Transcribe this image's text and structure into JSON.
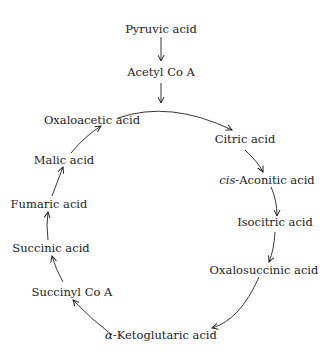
{
  "diagram": {
    "entry": [
      {
        "label": "Pyruvic acid"
      },
      {
        "label": "Acetyl Co A"
      }
    ],
    "cycle": [
      {
        "label": "Oxaloacetic acid"
      },
      {
        "label": "Citric acid"
      },
      {
        "prefix": "cis",
        "label": "-Aconitic acid"
      },
      {
        "label": "Isocitric acid"
      },
      {
        "label": "Oxalosuccinic acid"
      },
      {
        "prefix": "α",
        "label": "-Ketoglutaric acid"
      },
      {
        "label": "Succinyl Co A"
      },
      {
        "label": "Succinic acid"
      },
      {
        "label": "Fumaric acid"
      },
      {
        "label": "Malic acid"
      }
    ],
    "edges": [
      [
        "Pyruvic acid",
        "Acetyl Co A"
      ],
      [
        "Acetyl Co A",
        "Citric acid"
      ],
      [
        "Oxaloacetic acid",
        "Citric acid"
      ],
      [
        "Citric acid",
        "cis-Aconitic acid"
      ],
      [
        "cis-Aconitic acid",
        "Isocitric acid"
      ],
      [
        "Isocitric acid",
        "Oxalosuccinic acid"
      ],
      [
        "Oxalosuccinic acid",
        "α-Ketoglutaric acid"
      ],
      [
        "α-Ketoglutaric acid",
        "Succinyl Co A"
      ],
      [
        "Succinyl Co A",
        "Succinic acid"
      ],
      [
        "Succinic acid",
        "Fumaric acid"
      ],
      [
        "Fumaric acid",
        "Malic acid"
      ],
      [
        "Malic acid",
        "Oxaloacetic acid"
      ]
    ]
  }
}
